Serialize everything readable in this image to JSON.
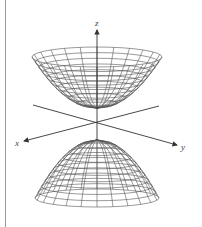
{
  "figure": {
    "axes": {
      "x_label": "x",
      "y_label": "y",
      "z_label": "z"
    },
    "colors": {
      "line": "#333333",
      "mesh": "#555555",
      "border": "#9a9a9a",
      "background": "#ffffff"
    }
  }
}
